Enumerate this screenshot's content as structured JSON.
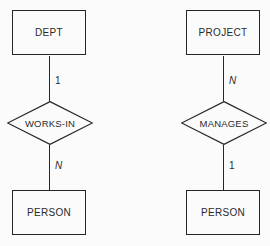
{
  "canvas": {
    "background_color": "#fbfbfb",
    "line_color": "#262626",
    "text_color": "#2a2a2a"
  },
  "diagrams": [
    {
      "id": "works-in",
      "top_entity": "DEPT",
      "top_cardinality": "1",
      "top_cardinality_italic": false,
      "relationship": "WORKS-IN",
      "bottom_cardinality": "N",
      "bottom_cardinality_italic": true,
      "bottom_entity": "PERSON"
    },
    {
      "id": "manages",
      "top_entity": "PROJECT",
      "top_cardinality": "N",
      "top_cardinality_italic": true,
      "relationship": "MANAGES",
      "bottom_cardinality": "1",
      "bottom_cardinality_italic": false,
      "bottom_entity": "PERSON"
    }
  ]
}
